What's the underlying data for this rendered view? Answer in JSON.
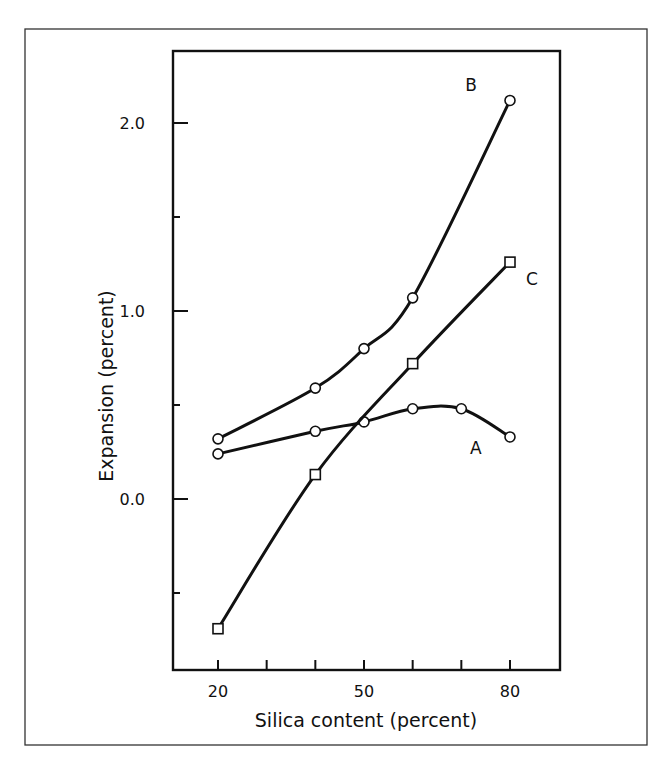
{
  "chart_data": {
    "type": "line",
    "title": "",
    "xlabel": "Silica content (percent)",
    "ylabel": "Expansion (percent)",
    "xlim": [
      14,
      87
    ],
    "ylim": [
      -0.9,
      2.4
    ],
    "x_ticks": [
      20,
      30,
      40,
      50,
      60,
      70,
      80
    ],
    "x_tick_labels": [
      {
        "value": 20,
        "label": "20"
      },
      {
        "value": 50,
        "label": "50"
      },
      {
        "value": 80,
        "label": "80"
      }
    ],
    "y_ticks": [
      -0.5,
      0.0,
      0.5,
      1.0,
      1.5,
      2.0
    ],
    "y_tick_labels": [
      {
        "value": 0.0,
        "label": "0.0"
      },
      {
        "value": 1.0,
        "label": "1.0"
      },
      {
        "value": 2.0,
        "label": "2.0"
      }
    ],
    "grid": false,
    "legend": "inline curve labels (A, B, C)",
    "series": [
      {
        "name": "A",
        "marker": "circle",
        "x": [
          20,
          40,
          50,
          60,
          70,
          80
        ],
        "values": [
          0.24,
          0.36,
          0.41,
          0.48,
          0.48,
          0.33
        ],
        "label_pos": {
          "x": 73,
          "y": 0.27
        }
      },
      {
        "name": "B",
        "marker": "circle",
        "x": [
          20,
          40,
          50,
          60,
          80
        ],
        "values": [
          0.32,
          0.59,
          0.8,
          1.07,
          2.12
        ],
        "label_pos": {
          "x": 72,
          "y": 2.2
        }
      },
      {
        "name": "C",
        "marker": "square",
        "x": [
          20,
          40,
          60,
          80
        ],
        "values": [
          -0.69,
          0.13,
          0.72,
          1.26
        ],
        "label_pos": {
          "x": 84.5,
          "y": 1.17
        }
      }
    ]
  }
}
